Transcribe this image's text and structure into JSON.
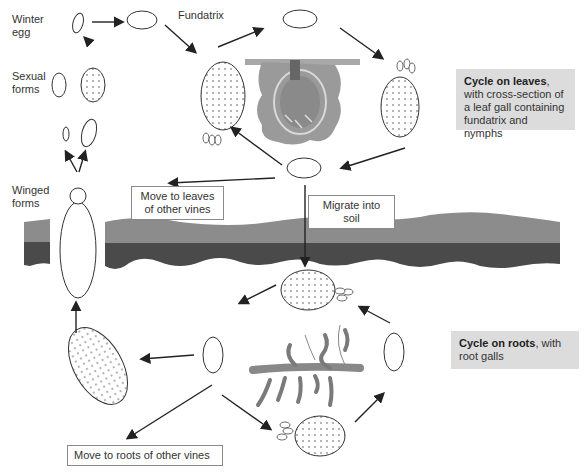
{
  "labels": {
    "winter_egg": "Winter egg",
    "winter_egg_line1": "Winter",
    "winter_egg_line2": "egg",
    "fundatrix": "Fundatrix",
    "sexual_forms_line1": "Sexual",
    "sexual_forms_line2": "forms",
    "winged_forms_line1": "Winged",
    "winged_forms_line2": "forms"
  },
  "boxes": {
    "move_leaves_line1": "Move to leaves",
    "move_leaves_line2": "of other vines",
    "migrate_soil": "Migrate into soil",
    "move_roots": "Move to roots of other vines"
  },
  "callouts": {
    "leaves": {
      "bold": "Cycle on leaves",
      "rest": ", with cross-section of a leaf gall containing fundatrix and nymphs"
    },
    "roots": {
      "bold": "Cycle on roots",
      "rest": ", with root galls"
    }
  },
  "colors": {
    "soil_light": "#8c8c8c",
    "soil_dark": "#4a4a4a",
    "gall_gray": "#9a9a9a",
    "callout_bg": "#dcdcdc",
    "line": "#222222"
  }
}
